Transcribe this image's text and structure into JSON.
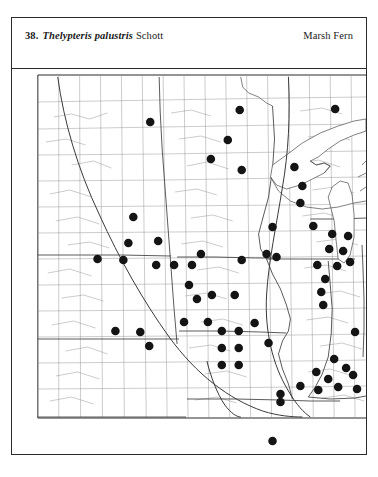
{
  "plate": {
    "number": "38.",
    "species_name": "Thelypteris palustris",
    "authority": "Schott",
    "common_name": "Marsh Fern"
  },
  "map": {
    "region_description": "Upper Midwest and central United States county map",
    "background_color": "#ffffff",
    "county_line_color": "#8d8d8d",
    "state_line_color": "#3d3d3d",
    "dot_color": "#141414",
    "frame_color": "#2b2b2b",
    "dot_radius": 4.3,
    "range_boundary_label": "glacial-boundary-line"
  },
  "chart_data": {
    "type": "scatter",
    "subtitle": "County-level occurrence dot map",
    "xlabel": "",
    "ylabel": "",
    "xlim": [
      0,
      356
    ],
    "ylim": [
      0,
      386
    ],
    "grid": false,
    "legend": "none",
    "series": [
      {
        "name": "county-occurrence",
        "marker": "filled-circle",
        "color": "#141414",
        "points": [
          [
            229,
            41
          ],
          [
            139,
            53
          ],
          [
            325,
            40
          ],
          [
            200,
            90
          ],
          [
            217,
            71
          ],
          [
            231,
            101
          ],
          [
            284,
            98
          ],
          [
            292,
            117
          ],
          [
            290,
            134
          ],
          [
            122,
            148
          ],
          [
            117,
            174
          ],
          [
            147,
            172
          ],
          [
            262,
            158
          ],
          [
            303,
            157
          ],
          [
            322,
            165
          ],
          [
            319,
            180
          ],
          [
            338,
            167
          ],
          [
            333,
            182
          ],
          [
            86,
            190
          ],
          [
            112,
            191
          ],
          [
            266,
            188
          ],
          [
            145,
            196
          ],
          [
            163,
            196
          ],
          [
            181,
            196
          ],
          [
            190,
            185
          ],
          [
            231,
            191
          ],
          [
            256,
            185
          ],
          [
            307,
            196
          ],
          [
            327,
            197
          ],
          [
            340,
            193
          ],
          [
            315,
            210
          ],
          [
            178,
            216
          ],
          [
            186,
            230
          ],
          [
            201,
            226
          ],
          [
            224,
            226
          ],
          [
            311,
            223
          ],
          [
            313,
            236
          ],
          [
            173,
            253
          ],
          [
            197,
            253
          ],
          [
            244,
            254
          ],
          [
            104,
            262
          ],
          [
            129,
            263
          ],
          [
            138,
            277
          ],
          [
            211,
            262
          ],
          [
            228,
            262
          ],
          [
            211,
            279
          ],
          [
            228,
            279
          ],
          [
            211,
            296
          ],
          [
            228,
            296
          ],
          [
            258,
            274
          ],
          [
            345,
            263
          ],
          [
            324,
            290
          ],
          [
            306,
            303
          ],
          [
            336,
            299
          ],
          [
            318,
            310
          ],
          [
            343,
            306
          ],
          [
            290,
            317
          ],
          [
            308,
            321
          ],
          [
            328,
            318
          ],
          [
            347,
            320
          ],
          [
            270,
            325
          ],
          [
            270,
            333
          ],
          [
            262,
            372
          ]
        ]
      }
    ]
  }
}
